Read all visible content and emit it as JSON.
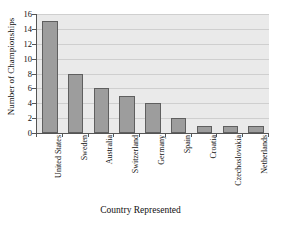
{
  "chart_data": {
    "type": "bar",
    "title": "",
    "xlabel": "Country Represented",
    "ylabel": "Number of Championships",
    "categories": [
      "United States",
      "Sweden",
      "Australia",
      "Switzerland",
      "Germany",
      "Spain",
      "Croatia",
      "Czechoslovakia",
      "Netherlands"
    ],
    "values": [
      15,
      8,
      6,
      5,
      4,
      2,
      1,
      1,
      1
    ],
    "ylim": [
      0,
      16
    ],
    "yticks": [
      0,
      2,
      4,
      6,
      8,
      10,
      12,
      14,
      16
    ],
    "ytick_labels": [
      "0",
      "2",
      "4",
      "6",
      "8",
      "10",
      "12",
      "14",
      "16"
    ],
    "grid": "horizontal",
    "legend": "none",
    "orientation": "vertical",
    "bar_color": "#9d9d9d",
    "bar_edge_color": "#5f5f5f",
    "plot_background": "#eaeaea",
    "gridline_color": "#cfcfcf",
    "axis_color": "#555555"
  }
}
